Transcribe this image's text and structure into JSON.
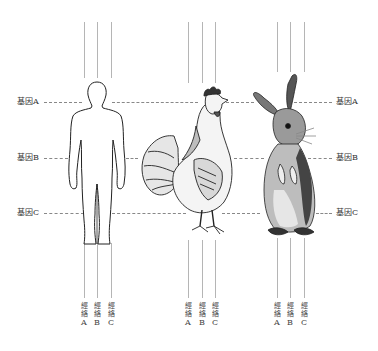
{
  "gene_labels_left": [
    "基因A",
    "基因B",
    "基因C"
  ],
  "gene_labels_right": [
    "基因A",
    "基因B",
    "基因C"
  ],
  "subjects": [
    {
      "name": "human",
      "meridians": [
        {
          "char1": "經",
          "char2": "絡",
          "letter": "A"
        },
        {
          "char1": "經",
          "char2": "絡",
          "letter": "B"
        },
        {
          "char1": "經",
          "char2": "絡",
          "letter": "C"
        }
      ]
    },
    {
      "name": "rooster",
      "meridians": [
        {
          "char1": "經",
          "char2": "絡",
          "letter": "A"
        },
        {
          "char1": "經",
          "char2": "絡",
          "letter": "B"
        },
        {
          "char1": "經",
          "char2": "絡",
          "letter": "C"
        }
      ]
    },
    {
      "name": "rabbit",
      "meridians": [
        {
          "char1": "經",
          "char2": "絡",
          "letter": "A"
        },
        {
          "char1": "經",
          "char2": "絡",
          "letter": "B"
        },
        {
          "char1": "經",
          "char2": "絡",
          "letter": "C"
        }
      ]
    }
  ],
  "colors": {
    "line": "#b5b5b5",
    "dash": "#888888",
    "ink": "#222222"
  }
}
